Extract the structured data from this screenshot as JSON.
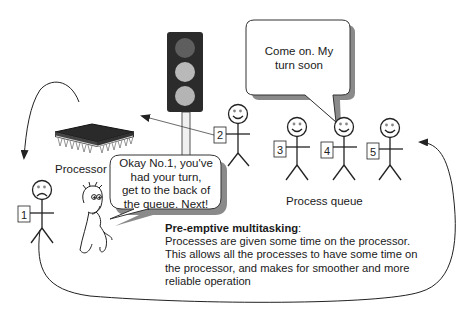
{
  "diagram": {
    "type": "illustration",
    "topic": "Pre-emptive multitasking"
  },
  "labels": {
    "processor": "Processor",
    "process_queue": "Process queue"
  },
  "bubbles": {
    "waiting_process": {
      "line1": "Come on. My",
      "line2": "turn soon"
    },
    "scheduler": {
      "line1": "Okay No.1, you've",
      "line2": "had your turn,",
      "line3": "get to the back of",
      "line4": "the queue. Next!"
    }
  },
  "processes": [
    {
      "id": "1",
      "mood": "sad",
      "location": "ejected"
    },
    {
      "id": "2",
      "mood": "happy",
      "location": "moving-to-processor"
    },
    {
      "id": "3",
      "mood": "happy",
      "location": "queue"
    },
    {
      "id": "4",
      "mood": "happy",
      "location": "queue"
    },
    {
      "id": "5",
      "mood": "happy",
      "location": "queue"
    }
  ],
  "caption": {
    "heading": "Pre-emptive multitasking",
    "heading_suffix": ":",
    "line1": "Processes are given some time on the processor.",
    "line2": "This allows all the processes to have some time on",
    "line3": "the processor, and makes for smoother and more",
    "line4": "reliable operation"
  },
  "colors": {
    "traffic_light_body": "#2b2b2b",
    "light_top": "#5e5e5e",
    "light_mid": "#b9b9b9",
    "light_bottom": "#b4b4b4",
    "chip": "#2a2a2a",
    "stroke": "#222222",
    "bubble_shadow": "#8a8a8a"
  }
}
